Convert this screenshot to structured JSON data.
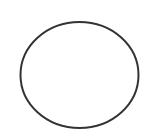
{
  "canvas": {
    "width": 141,
    "height": 130,
    "background": "#ffffff"
  },
  "shapes": [
    {
      "type": "ellipse",
      "cx": 79.5,
      "cy": 75,
      "rx": 59,
      "ry": 53,
      "stroke": "#333333",
      "stroke_width": 2,
      "fill": "none"
    }
  ]
}
